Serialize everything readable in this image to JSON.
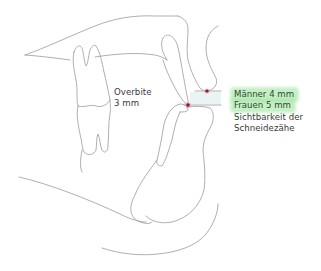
{
  "diagram": {
    "labels": {
      "overbite_line1": "Overbite",
      "overbite_line2": "3 mm",
      "men_value": "Männer 4 mm",
      "women_value": "Frauen 5 mm",
      "visibility_line1": "Sichtbarkeit der",
      "visibility_line2": "Schneidezähe"
    },
    "colors": {
      "outline": "#9a9a9a",
      "marker_dot": "#8b1a2a",
      "marker_halo": "#e88a9a",
      "highlight": "#9be39b",
      "gap_fill": "#eaf4f4",
      "text": "#3a3a3a"
    },
    "markers": [
      {
        "name": "upper-lip-point",
        "x": 207,
        "y": 91
      },
      {
        "name": "incisal-edge-point",
        "x": 188,
        "y": 105
      }
    ]
  }
}
